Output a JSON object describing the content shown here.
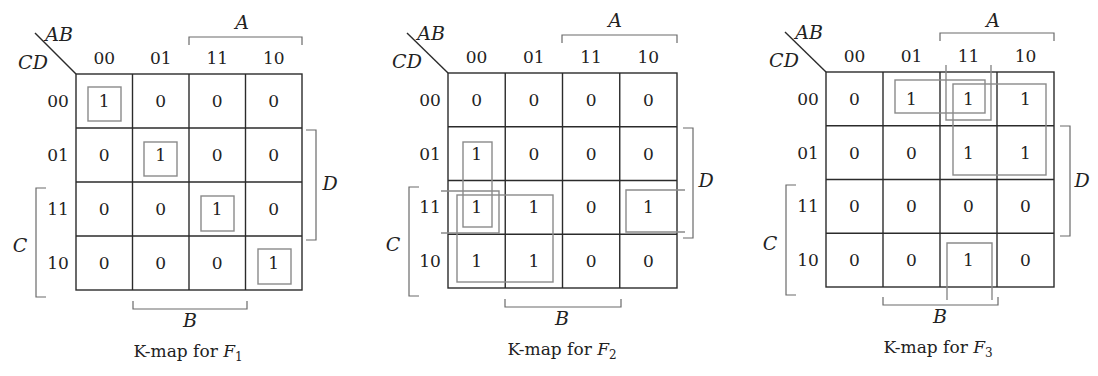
{
  "figure": {
    "column_codes": [
      "00",
      "01",
      "11",
      "10"
    ],
    "row_codes": [
      "00",
      "01",
      "11",
      "10"
    ],
    "row_var_label": "CD",
    "col_var_label": "AB",
    "bracket_labels": {
      "A": "A",
      "B": "B",
      "C": "C",
      "D": "D"
    },
    "caption_prefix": "K-map for ",
    "caption_var": "F"
  },
  "kmaps": [
    {
      "name": "F1",
      "caption_subscript": "1",
      "origin": {
        "x": 76,
        "y": 74
      },
      "size": {
        "w": 226,
        "h": 216
      },
      "cells": [
        [
          "1",
          "0",
          "0",
          "0"
        ],
        [
          "0",
          "1",
          "0",
          "0"
        ],
        [
          "0",
          "0",
          "1",
          "0"
        ],
        [
          "0",
          "0",
          "0",
          "1"
        ]
      ],
      "groups": [
        {
          "type": "rect",
          "x": 88,
          "y": 87,
          "w": 33,
          "h": 34
        },
        {
          "type": "rect",
          "x": 144,
          "y": 142,
          "w": 33,
          "h": 34
        },
        {
          "type": "rect",
          "x": 201,
          "y": 196,
          "w": 33,
          "h": 35
        },
        {
          "type": "rect",
          "x": 258,
          "y": 249,
          "w": 33,
          "h": 35
        }
      ],
      "labels": {
        "ab": {
          "x": 59,
          "y": 34
        },
        "cd": {
          "x": 33,
          "y": 62
        },
        "diag": [
          35,
          33,
          76,
          74
        ],
        "A": {
          "x": 242,
          "y": 22,
          "bx1": 189,
          "bx2": 302,
          "by": 37
        },
        "B": {
          "x": 190,
          "y": 320,
          "bx1": 133,
          "bx2": 247,
          "by": 309
        },
        "C": {
          "x": 20,
          "y": 245,
          "bx": 36,
          "by1": 188,
          "by2": 297
        },
        "D": {
          "x": 330,
          "y": 183,
          "bx": 316,
          "by1": 130,
          "by2": 240
        },
        "caption": {
          "x": 188,
          "y": 357
        }
      }
    },
    {
      "name": "F2",
      "caption_subscript": "2",
      "origin": {
        "x": 448,
        "y": 73
      },
      "size": {
        "w": 229,
        "h": 215
      },
      "cells": [
        [
          "0",
          "0",
          "0",
          "0"
        ],
        [
          "1",
          "0",
          "0",
          "0"
        ],
        [
          "1",
          "1",
          "0",
          "1"
        ],
        [
          "1",
          "1",
          "0",
          "0"
        ]
      ],
      "groups": [
        {
          "type": "rect",
          "x": 463,
          "y": 142,
          "w": 29,
          "h": 85
        },
        {
          "type": "rect",
          "x": 457,
          "y": 195,
          "w": 96,
          "h": 87
        },
        {
          "type": "open-left",
          "x1": 441,
          "x2": 499,
          "y1": 191,
          "y2": 233
        },
        {
          "type": "open-right",
          "x1": 626,
          "x2": 685,
          "y1": 190,
          "y2": 232
        }
      ],
      "labels": {
        "ab": {
          "x": 431,
          "y": 33
        },
        "cd": {
          "x": 407,
          "y": 61
        },
        "diag": [
          407,
          33,
          448,
          73
        ],
        "A": {
          "x": 615,
          "y": 20,
          "bx1": 562,
          "bx2": 677,
          "by": 35
        },
        "B": {
          "x": 562,
          "y": 318,
          "bx1": 505,
          "bx2": 621,
          "by": 307
        },
        "C": {
          "x": 393,
          "y": 244,
          "bx": 409,
          "by1": 187,
          "by2": 296
        },
        "D": {
          "x": 706,
          "y": 180,
          "bx": 693,
          "by1": 128,
          "by2": 238
        },
        "caption": {
          "x": 562,
          "y": 355
        }
      }
    },
    {
      "name": "F3",
      "caption_subscript": "3",
      "origin": {
        "x": 826,
        "y": 72
      },
      "size": {
        "w": 228,
        "h": 215
      },
      "cells": [
        [
          "0",
          "1",
          "1",
          "1"
        ],
        [
          "0",
          "0",
          "1",
          "1"
        ],
        [
          "0",
          "0",
          "0",
          "0"
        ],
        [
          "0",
          "0",
          "1",
          "0"
        ]
      ],
      "groups": [
        {
          "type": "rect",
          "x": 953,
          "y": 84,
          "w": 93,
          "h": 91
        },
        {
          "type": "rect",
          "x": 895,
          "y": 80,
          "w": 90,
          "h": 33
        },
        {
          "type": "open-top",
          "x1": 946,
          "x2": 991,
          "y1": 65,
          "y2": 120
        },
        {
          "type": "open-bottom",
          "x1": 947,
          "x2": 992,
          "y1": 243,
          "y2": 300
        }
      ],
      "labels": {
        "ab": {
          "x": 809,
          "y": 32
        },
        "cd": {
          "x": 784,
          "y": 60
        },
        "diag": [
          785,
          32,
          826,
          72
        ],
        "A": {
          "x": 993,
          "y": 20,
          "bx1": 940,
          "bx2": 1054,
          "by": 33
        },
        "B": {
          "x": 940,
          "y": 316,
          "bx1": 883,
          "bx2": 998,
          "by": 305
        },
        "C": {
          "x": 770,
          "y": 243,
          "bx": 786,
          "by1": 185,
          "by2": 295
        },
        "D": {
          "x": 1082,
          "y": 180,
          "bx": 1070,
          "by1": 126,
          "by2": 236
        },
        "caption": {
          "x": 938,
          "y": 353
        }
      }
    }
  ],
  "colors": {
    "grid": "#2b2b2b",
    "group": "#8a8a8a",
    "bracket": "#6a6a6a",
    "text": "#222222",
    "background": "#ffffff"
  }
}
